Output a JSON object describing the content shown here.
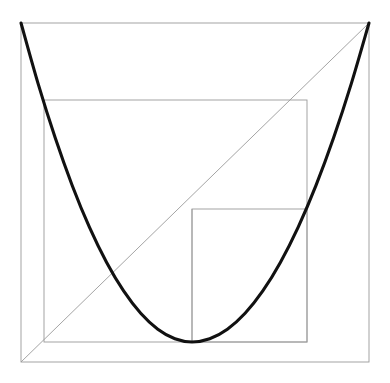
{
  "figure": {
    "background_color": "#ffffff",
    "curve_color": "#111111",
    "grid_color": "#9a9a9a",
    "canvas": {
      "width": 390,
      "height": 383
    },
    "outer_box": {
      "label": "outer square",
      "x1": 21,
      "y1": 23,
      "x2": 369,
      "y2": 362
    },
    "inner_box": {
      "label": "second square",
      "x1": 44,
      "y1": 100,
      "x2": 307,
      "y2": 342
    },
    "small_box": {
      "label": "third square",
      "x1": 192,
      "y1": 209,
      "x2": 307,
      "y2": 342
    },
    "diagonal": {
      "label": "identity line y = x",
      "x1": 21,
      "y1": 362,
      "x2": 369,
      "y2": 23
    },
    "vertex_drop": {
      "label": "vertical from vertex",
      "x1": 192,
      "y1": 209,
      "x2": 192,
      "y2": 342
    }
  },
  "chart_data": {
    "type": "line",
    "subtitle": "",
    "xlabel": "",
    "ylabel": "",
    "xlim": [
      -1,
      1
    ],
    "ylim": [
      0,
      1
    ],
    "grid": false,
    "legend_position": "none",
    "axis_ticks_x": [],
    "axis_ticks_y": [],
    "annotations": [],
    "series": [
      {
        "name": "parabola",
        "equation": "y = x^2",
        "color": "#111111",
        "linewidth": 3.1,
        "x": [
          -1.0,
          -0.9,
          -0.8,
          -0.7,
          -0.6,
          -0.5,
          -0.4,
          -0.3,
          -0.2,
          -0.1,
          0.0,
          0.1,
          0.2,
          0.3,
          0.4,
          0.5,
          0.6,
          0.7,
          0.8,
          0.9,
          1.0
        ],
        "values": [
          1.0,
          0.81,
          0.64,
          0.49,
          0.36,
          0.25,
          0.16,
          0.09,
          0.04,
          0.01,
          0.0,
          0.01,
          0.04,
          0.09,
          0.16,
          0.25,
          0.36,
          0.49,
          0.64,
          0.81,
          1.0
        ]
      },
      {
        "name": "diagonal",
        "equation": "y = (x + 1) / 2",
        "color": "#9a9a9a",
        "linewidth": 0.9,
        "x": [
          -1.0,
          1.0
        ],
        "values": [
          0.0,
          1.0
        ]
      }
    ],
    "shapes": [
      {
        "name": "outer square",
        "type": "rect",
        "x": -1.0,
        "y": 0.0,
        "width": 2.0,
        "height": 1.0,
        "edgecolor": "#9a9a9a"
      },
      {
        "name": "second square",
        "type": "rect",
        "x": -0.868,
        "y": 0.059,
        "width": 1.511,
        "height": 0.714,
        "edgecolor": "#9a9a9a"
      },
      {
        "name": "third square",
        "type": "rect",
        "x": -0.018,
        "y": 0.059,
        "width": 0.661,
        "height": 0.392,
        "edgecolor": "#9a9a9a"
      }
    ]
  }
}
